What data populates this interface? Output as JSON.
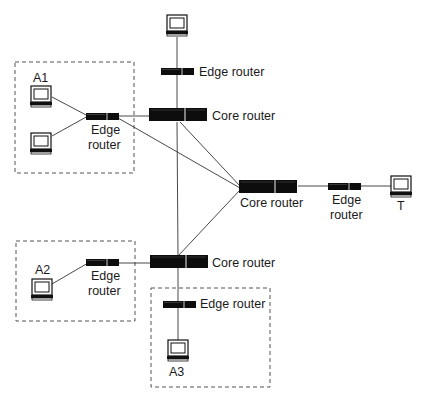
{
  "diagram": {
    "type": "network-topology",
    "nodes": [
      {
        "id": "host-top",
        "kind": "host",
        "label": ""
      },
      {
        "id": "edge-top",
        "kind": "edge-router",
        "label": "Edge router"
      },
      {
        "id": "core-top",
        "kind": "core-router",
        "label": "Core router"
      },
      {
        "id": "host-a1-1",
        "kind": "host",
        "label": "A1"
      },
      {
        "id": "host-a1-2",
        "kind": "host",
        "label": ""
      },
      {
        "id": "edge-a1",
        "kind": "edge-router",
        "label_line1": "Edge",
        "label_line2": "router"
      },
      {
        "id": "core-right",
        "kind": "core-router",
        "label": "Core router"
      },
      {
        "id": "edge-t",
        "kind": "edge-router",
        "label_line1": "Edge",
        "label_line2": "router"
      },
      {
        "id": "host-t",
        "kind": "host",
        "label": "T"
      },
      {
        "id": "core-bottom",
        "kind": "core-router",
        "label": "Core router"
      },
      {
        "id": "edge-a2",
        "kind": "edge-router",
        "label_line1": "Edge",
        "label_line2": "router"
      },
      {
        "id": "host-a2",
        "kind": "host",
        "label": "A2"
      },
      {
        "id": "edge-a3",
        "kind": "edge-router",
        "label": "Edge router"
      },
      {
        "id": "host-a3",
        "kind": "host",
        "label": "A3"
      }
    ],
    "links": [
      [
        "host-top",
        "edge-top"
      ],
      [
        "edge-top",
        "core-top"
      ],
      [
        "host-a1-1",
        "edge-a1"
      ],
      [
        "host-a1-2",
        "edge-a1"
      ],
      [
        "edge-a1",
        "core-top"
      ],
      [
        "edge-a1",
        "core-right"
      ],
      [
        "core-top",
        "core-right"
      ],
      [
        "core-top",
        "core-bottom"
      ],
      [
        "core-bottom",
        "core-right"
      ],
      [
        "core-right",
        "edge-t"
      ],
      [
        "edge-t",
        "host-t"
      ],
      [
        "edge-a2",
        "host-a2"
      ],
      [
        "edge-a2",
        "core-bottom"
      ],
      [
        "core-bottom",
        "edge-a3"
      ],
      [
        "edge-a3",
        "host-a3"
      ]
    ],
    "groups": [
      "A1",
      "A2",
      "A3"
    ],
    "colors": {
      "device": "#0d0d0d",
      "line": "#333333",
      "box": "#555555"
    }
  }
}
